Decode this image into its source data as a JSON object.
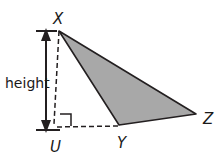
{
  "figure": {
    "background_color": "#ffffff",
    "stroke_color": "#231f20",
    "shaded_fill": "#a8a8a8",
    "labels": {
      "apex": "X",
      "base_left": "Y",
      "base_right": "Z",
      "foot": "U",
      "height": "height"
    },
    "points": {
      "X": {
        "x": 59,
        "y": 31
      },
      "Y": {
        "x": 119,
        "y": 125
      },
      "Z": {
        "x": 196,
        "y": 114
      },
      "U": {
        "x": 53,
        "y": 127
      }
    },
    "segments": [
      {
        "name": "side-XY",
        "style": "solid"
      },
      {
        "name": "side-YZ",
        "style": "solid"
      },
      {
        "name": "side-XZ",
        "style": "solid"
      },
      {
        "name": "altitude-XU",
        "style": "dashed"
      },
      {
        "name": "base-extension-UY",
        "style": "dashed"
      }
    ],
    "markers": {
      "right_angle_at": "U",
      "height_arrow": "double-headed"
    }
  }
}
